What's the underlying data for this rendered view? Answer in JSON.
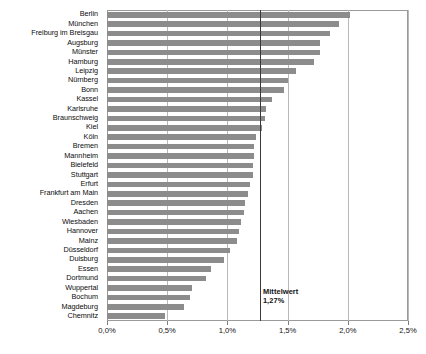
{
  "chart_data": {
    "type": "bar",
    "orientation": "horizontal",
    "title": "",
    "subtitle": "",
    "xlabel": "",
    "ylabel": "",
    "xlim": [
      0,
      2.5
    ],
    "grid": true,
    "legend": null,
    "xticks": [
      "0,0%",
      "0,5%",
      "1,0%",
      "1,5%",
      "2,0%",
      "2,5%"
    ],
    "xtick_values": [
      0,
      0.5,
      1.0,
      1.5,
      2.0,
      2.5
    ],
    "value_suffix": "%",
    "bar_color": "#8c8c8c",
    "grid_color": "#b9b9b9",
    "categories": [
      "Berlin",
      "München",
      "Freiburg im Breisgau",
      "Augsburg",
      "Münster",
      "Hamburg",
      "Leipzig",
      "Nürnberg",
      "Bonn",
      "Kassel",
      "Karlsruhe",
      "Braunschweig",
      "Kiel",
      "Köln",
      "Bremen",
      "Mannheim",
      "Bielefeld",
      "Stuttgart",
      "Erfurt",
      "Frankfurt am Main",
      "Dresden",
      "Aachen",
      "Wiesbaden",
      "Hannover",
      "Mainz",
      "Düsseldorf",
      "Duisburg",
      "Essen",
      "Dortmund",
      "Wuppertal",
      "Bochum",
      "Magdeburg",
      "Chemnitz"
    ],
    "values": [
      2.02,
      1.93,
      1.85,
      1.77,
      1.77,
      1.72,
      1.57,
      1.5,
      1.47,
      1.37,
      1.32,
      1.31,
      1.29,
      1.24,
      1.22,
      1.22,
      1.21,
      1.21,
      1.19,
      1.17,
      1.15,
      1.14,
      1.11,
      1.1,
      1.08,
      1.02,
      0.97,
      0.86,
      0.82,
      0.71,
      0.69,
      0.64,
      0.48
    ],
    "annotations": [
      {
        "name": "mittelwert",
        "label_line1": "Mittelwert",
        "label_line2": "1,27%",
        "value": 1.27,
        "type": "vertical-line"
      }
    ]
  }
}
